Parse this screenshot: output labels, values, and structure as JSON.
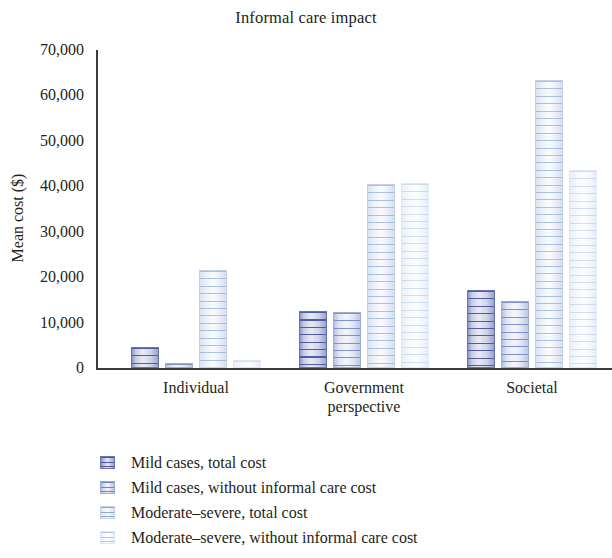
{
  "chart_data": {
    "type": "bar",
    "title": "Informal care impact",
    "xlabel": "",
    "ylabel": "Mean cost ($)",
    "categories": [
      "Individual",
      "Government perspective",
      "Societal"
    ],
    "category_lines": [
      [
        "Individual"
      ],
      [
        "Government",
        "perspective"
      ],
      [
        "Societal"
      ]
    ],
    "ylim": [
      0,
      70000
    ],
    "ytick_values": [
      0,
      10000,
      20000,
      30000,
      40000,
      50000,
      60000,
      70000
    ],
    "ytick_labels": [
      "0",
      "10,000",
      "20,000",
      "30,000",
      "40,000",
      "50,000",
      "60,000",
      "70,000"
    ],
    "grid": false,
    "legend_position": "below",
    "series": [
      {
        "name": "Mild cases, total cost",
        "color": "#8f99c9",
        "values": [
          4600,
          12500,
          17200
        ]
      },
      {
        "name": "Mild cases, without informal care cost",
        "color": "#b9c3e0",
        "values": [
          1200,
          12400,
          14800
        ]
      },
      {
        "name": "Moderate-severe, total cost",
        "color": "#dbe3f2",
        "values": [
          21600,
          40600,
          63500
        ]
      },
      {
        "name": "Moderate–severe, without informal care cost",
        "color": "#eaf0fa",
        "values": [
          1700,
          40700,
          43600
        ]
      }
    ]
  },
  "legend": {
    "items": [
      {
        "label": "Mild cases, total cost"
      },
      {
        "label": "Mild cases, without informal care cost"
      },
      {
        "label": "Moderate–severe, total cost"
      },
      {
        "label": "Moderate–severe, without informal care cost"
      }
    ]
  }
}
